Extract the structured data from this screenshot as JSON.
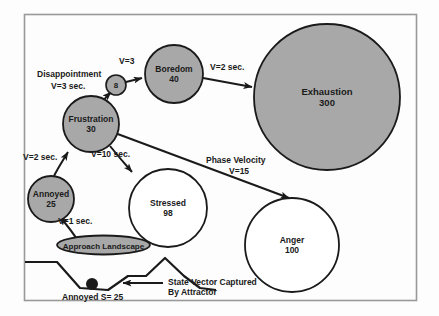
{
  "figure": {
    "frame": {
      "stroke": "#9a9a9a"
    },
    "background": "#fdfdfd",
    "filled_node_color": "#a8a8a8",
    "open_node_color": "#ffffff",
    "stroke_color": "#1a1a1a"
  },
  "nodes": [
    {
      "id": "disappointment_hub",
      "label": "8",
      "value": "",
      "style": "filled",
      "cx": 116,
      "cy": 85,
      "r": 10
    },
    {
      "id": "boredom",
      "label": "Boredom",
      "value": "40",
      "style": "filled",
      "cx": 174,
      "cy": 74,
      "r": 29
    },
    {
      "id": "exhaustion",
      "label": "Exhaustion",
      "value": "300",
      "style": "filled",
      "cx": 327,
      "cy": 97,
      "r": 73
    },
    {
      "id": "frustration",
      "label": "Frustration",
      "value": "30",
      "style": "filled",
      "cx": 91,
      "cy": 124,
      "r": 28
    },
    {
      "id": "annoyed",
      "label": "Annoyed",
      "value": "25",
      "style": "filled",
      "cx": 51,
      "cy": 199,
      "r": 23
    },
    {
      "id": "stressed",
      "label": "Stressed",
      "value": "98",
      "style": "open",
      "cx": 168,
      "cy": 208,
      "r": 39
    },
    {
      "id": "anger",
      "label": "Anger",
      "value": "100",
      "style": "open",
      "cx": 292,
      "cy": 245,
      "r": 47
    }
  ],
  "edges": [
    {
      "id": "approach-to-annoyed",
      "label": "V=1 sec."
    },
    {
      "id": "annoyed-to-frustration",
      "label": "V=2 sec."
    },
    {
      "id": "frustration-to-hub",
      "label": "V=3 sec."
    },
    {
      "id": "hub-to-boredom",
      "label": "V=3"
    },
    {
      "id": "boredom-to-exhaustion",
      "label": "V=2 sec."
    },
    {
      "id": "frustration-to-stressed",
      "label": "V=10 sec."
    },
    {
      "id": "frustration-to-anger",
      "label": "V=15"
    }
  ],
  "annotations": {
    "disappointment": "Disappointment",
    "phase_velocity": "Phase Velocity",
    "approach_landscape": "Approach Landscape",
    "state_vector_line1": "State Vector Captured",
    "state_vector_line2": "By Attractor",
    "annoyed_state": "Annoyed S= 25"
  }
}
